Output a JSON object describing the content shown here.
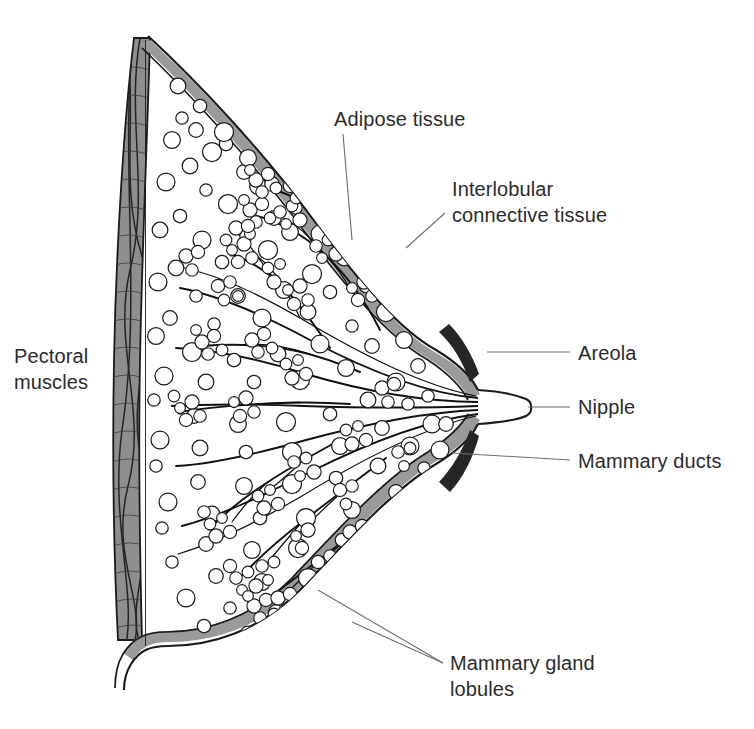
{
  "figure": {
    "background_color": "#ffffff",
    "width": 754,
    "height": 729,
    "watermark_text": ""
  },
  "palette": {
    "outline": "#1a1a1a",
    "text": "#2b2b2b",
    "leader_line": "#6d6d6d",
    "skin_band": "#9a9a9a",
    "areola_dark": "#262626",
    "muscle_fill": "#8e8e8e",
    "cell_fill": "#ffffff"
  },
  "labels": [
    {
      "id": "adipose-tissue",
      "text": "Adipose tissue",
      "lines": [
        "Adipose tissue"
      ],
      "x": 334,
      "y": 126,
      "anchor": "start",
      "leader": "M 343 134 L 352 240"
    },
    {
      "id": "interlobular-connective-tissue",
      "text": "Interlobular connective tissue",
      "lines": [
        "Interlobular",
        "connective tissue"
      ],
      "x": 452,
      "y": 211,
      "anchor": "start",
      "leader": "M 445 213 L 408 247"
    },
    {
      "id": "areola",
      "text": "Areola",
      "lines": [
        "Areola"
      ],
      "x": 578,
      "y": 360,
      "anchor": "start",
      "leader": "M 570 352 L 487 352"
    },
    {
      "id": "nipple",
      "text": "Nipple",
      "lines": [
        "Nipple"
      ],
      "x": 578,
      "y": 414,
      "anchor": "start",
      "leader": "M 570 407 L 528 407"
    },
    {
      "id": "mammary-ducts",
      "text": "Mammary ducts",
      "lines": [
        "Mammary ducts"
      ],
      "x": 578,
      "y": 468,
      "anchor": "start",
      "leader": "M 570 460 L 452 453"
    },
    {
      "id": "mammary-gland-lobules",
      "text": "Mammary gland lobules",
      "lines": [
        "Mammary gland",
        "lobules"
      ],
      "x": 450,
      "y": 670,
      "anchor": "start",
      "leaders": [
        "M 443 663 L 318 590",
        "M 443 663 L 350 620"
      ]
    },
    {
      "id": "pectoral-muscles",
      "text": "Pectoral muscles",
      "lines": [
        "Pectoral",
        "muscles"
      ],
      "x": 14,
      "y": 363,
      "anchor": "start",
      "leader": ""
    }
  ],
  "structures": {
    "skin_outer_path": "M 148 36 C 196 80 262 150 315 222 C 362 286 400 330 436 350 C 456 362 470 374 478 390",
    "skin_outer_lower_path": "M 478 424 C 470 440 456 452 436 464 C 392 490 340 548 300 590 C 258 632 210 646 168 646 C 150 646 140 650 131 664 C 126 672 124 680 124 690",
    "skin_band_upper": "M 150 40 C 198 84 264 154 317 226 C 364 290 402 334 438 354 C 458 366 472 378 480 394 L 470 398 C 462 382 448 370 430 358 C 394 338 354 294 307 230 C 254 158 190 88 142 44 Z",
    "skin_band_lower": "M 480 420 C 472 436 458 448 438 460 C 394 486 342 544 302 586 C 260 628 212 642 170 642 C 152 642 142 646 133 660 L 124 654 C 134 638 148 632 168 632 C 208 632 254 618 294 578 C 334 536 386 478 430 452 C 448 440 462 428 470 414 Z",
    "muscle_outline": "M 150 38 C 148 120 142 250 140 360 C 138 470 140 560 142 640 C 128 640 120 636 118 620 C 114 560 112 470 114 360 C 116 250 124 120 134 40 Z",
    "nipple_path": "M 478 390 C 492 392 512 394 524 398 C 530 400 530 414 524 416 C 512 420 492 422 478 424",
    "chest_wall_x": 140,
    "areola_upper": "M 452 330 C 462 338 472 354 478 372 L 470 378 C 462 358 452 344 442 336 Z",
    "areola_lower": "M 478 442 C 472 460 462 476 452 484 L 442 478 C 452 470 462 456 470 436 Z"
  },
  "counts": {
    "adipose_cells": 148,
    "lobule_clusters": 34,
    "duct_branches": 12
  }
}
